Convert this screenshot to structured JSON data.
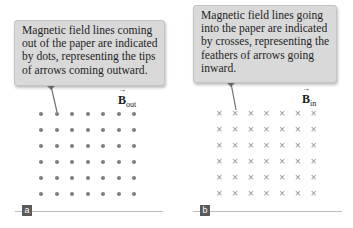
{
  "panels": [
    {
      "id": "a",
      "label": "a",
      "callout_lines": [
        "Magnetic field lines coming",
        "out of the paper are indicated",
        "by dots, representing the tips",
        "of arrows coming outward."
      ],
      "vector_symbol": "B",
      "vector_subscript": "out",
      "marker": "dot",
      "marker_glyph": "•",
      "rows": 6,
      "cols": 7
    },
    {
      "id": "b",
      "label": "b",
      "callout_lines": [
        "Magnetic field lines going",
        "into the paper are indicated",
        "by crosses, representing the",
        "feathers of arrows going",
        "inward."
      ],
      "vector_symbol": "B",
      "vector_subscript": "in",
      "marker": "cross",
      "marker_glyph": "×",
      "rows": 6,
      "cols": 7
    }
  ],
  "colors": {
    "callout_bg": "#d9d9d9",
    "marker": "#7d7d7d",
    "label_bg": "#5a5a5a",
    "baseline": "#bdbdbd"
  },
  "arrow_glyph": "→"
}
